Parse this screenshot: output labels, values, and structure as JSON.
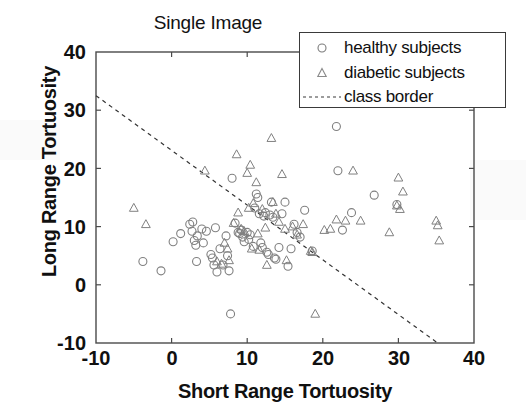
{
  "chart_data": {
    "type": "scatter",
    "title": "Single Image",
    "xlabel": "Short Range Tortuosity",
    "ylabel": "Long Range Tortuosity",
    "xlim": [
      -10,
      40
    ],
    "ylim": [
      -10,
      40
    ],
    "xticks": [
      -10,
      0,
      10,
      20,
      30,
      40
    ],
    "yticks": [
      -10,
      0,
      10,
      20,
      30,
      40
    ],
    "xtick_labels": [
      "-10",
      "0",
      "10",
      "20",
      "30",
      "40"
    ],
    "ytick_labels": [
      "-10",
      "0",
      "10",
      "20",
      "30",
      "40"
    ],
    "grid": false,
    "legend_position": "top-right",
    "series": [
      {
        "name": "healthy subjects",
        "marker": "circle",
        "color": "#808080",
        "points": [
          [
            -3.8,
            4.0
          ],
          [
            -1.4,
            2.4
          ],
          [
            0.2,
            7.4
          ],
          [
            1.2,
            8.8
          ],
          [
            2.4,
            10.4
          ],
          [
            2.8,
            10.8
          ],
          [
            2.7,
            9.2
          ],
          [
            3.0,
            7.6
          ],
          [
            3.2,
            6.8
          ],
          [
            3.4,
            8.4
          ],
          [
            3.3,
            4.0
          ],
          [
            4.0,
            9.6
          ],
          [
            4.2,
            7.2
          ],
          [
            4.6,
            9.2
          ],
          [
            5.2,
            5.2
          ],
          [
            5.4,
            4.6
          ],
          [
            5.6,
            3.4
          ],
          [
            5.8,
            9.8
          ],
          [
            6.0,
            2.2
          ],
          [
            6.4,
            6.2
          ],
          [
            6.8,
            3.4
          ],
          [
            7.2,
            8.4
          ],
          [
            7.4,
            5.0
          ],
          [
            7.6,
            2.4
          ],
          [
            7.8,
            -5.0
          ],
          [
            8.0,
            18.3
          ],
          [
            8.4,
            10.6
          ],
          [
            8.8,
            9.0
          ],
          [
            9.0,
            8.8
          ],
          [
            9.2,
            9.4
          ],
          [
            9.4,
            8.2
          ],
          [
            9.6,
            7.4
          ],
          [
            10.0,
            9.0
          ],
          [
            10.2,
            7.8
          ],
          [
            10.4,
            8.6
          ],
          [
            10.8,
            6.6
          ],
          [
            11.0,
            13.2
          ],
          [
            11.2,
            15.6
          ],
          [
            11.4,
            15.0
          ],
          [
            11.6,
            12.2
          ],
          [
            11.8,
            7.2
          ],
          [
            12.0,
            6.4
          ],
          [
            12.2,
            11.8
          ],
          [
            12.4,
            12.4
          ],
          [
            12.6,
            5.6
          ],
          [
            12.8,
            5.2
          ],
          [
            13.0,
            12.0
          ],
          [
            13.2,
            14.2
          ],
          [
            13.4,
            11.6
          ],
          [
            13.6,
            4.6
          ],
          [
            13.8,
            4.4
          ],
          [
            14.2,
            6.4
          ],
          [
            14.6,
            12.2
          ],
          [
            15.0,
            14.2
          ],
          [
            15.4,
            3.2
          ],
          [
            15.8,
            6.2
          ],
          [
            16.2,
            10.4
          ],
          [
            16.6,
            9.0
          ],
          [
            17.0,
            8.2
          ],
          [
            17.6,
            12.8
          ],
          [
            18.6,
            5.8
          ],
          [
            21.8,
            27.2
          ],
          [
            22.0,
            19.6
          ],
          [
            22.6,
            9.4
          ],
          [
            23.8,
            12.4
          ],
          [
            26.8,
            15.4
          ],
          [
            29.8,
            13.8
          ]
        ]
      },
      {
        "name": "diabetic subjects",
        "marker": "triangle",
        "color": "#808080",
        "points": [
          [
            -5.0,
            13.2
          ],
          [
            -3.4,
            10.4
          ],
          [
            4.4,
            19.6
          ],
          [
            6.0,
            4.0
          ],
          [
            6.6,
            3.6
          ],
          [
            7.0,
            7.2
          ],
          [
            7.4,
            6.2
          ],
          [
            7.6,
            4.2
          ],
          [
            8.2,
            10.6
          ],
          [
            8.6,
            22.4
          ],
          [
            8.8,
            12.4
          ],
          [
            9.2,
            9.6
          ],
          [
            9.6,
            9.2
          ],
          [
            10.0,
            19.2
          ],
          [
            10.2,
            13.2
          ],
          [
            10.4,
            20.6
          ],
          [
            10.6,
            6.2
          ],
          [
            10.8,
            14.0
          ],
          [
            11.2,
            17.6
          ],
          [
            11.4,
            8.8
          ],
          [
            11.6,
            6.0
          ],
          [
            12.0,
            13.0
          ],
          [
            12.4,
            9.8
          ],
          [
            12.6,
            3.4
          ],
          [
            13.2,
            25.2
          ],
          [
            13.4,
            14.2
          ],
          [
            13.8,
            12.2
          ],
          [
            14.2,
            10.8
          ],
          [
            14.6,
            19.0
          ],
          [
            15.0,
            9.6
          ],
          [
            15.2,
            4.2
          ],
          [
            16.0,
            10.0
          ],
          [
            16.6,
            8.6
          ],
          [
            17.4,
            10.4
          ],
          [
            18.4,
            5.8
          ],
          [
            18.6,
            5.6
          ],
          [
            19.0,
            -5.0
          ],
          [
            20.2,
            9.4
          ],
          [
            21.0,
            9.6
          ],
          [
            21.8,
            11.2
          ],
          [
            23.0,
            11.0
          ],
          [
            24.0,
            19.6
          ],
          [
            25.0,
            11.0
          ],
          [
            28.8,
            9.0
          ],
          [
            29.8,
            13.6
          ],
          [
            30.0,
            18.4
          ],
          [
            30.2,
            13.0
          ],
          [
            30.6,
            16.0
          ],
          [
            35.0,
            11.0
          ],
          [
            35.2,
            10.2
          ],
          [
            35.4,
            7.6
          ]
        ]
      }
    ],
    "class_border": {
      "label": "class border",
      "style": "dashed",
      "color": "#333333",
      "x0": -10,
      "y0": 32.5,
      "x1": 35.2,
      "y1": -10
    }
  },
  "legend": {
    "entries": [
      {
        "label": "healthy subjects",
        "symbol": "circle-marker"
      },
      {
        "label": "diabetic subjects",
        "symbol": "triangle-marker"
      },
      {
        "label": "class border",
        "symbol": "dashed-line"
      }
    ]
  }
}
